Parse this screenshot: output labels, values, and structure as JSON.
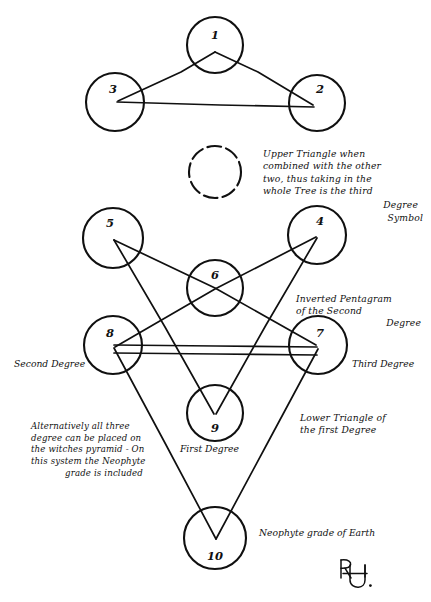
{
  "diagram": {
    "ink_color": "#101010",
    "background_color": "#ffffff",
    "spheres": [
      {
        "id": "sphere-1",
        "number": "1",
        "cx": 215,
        "cy": 45,
        "r": 28,
        "style": "solid"
      },
      {
        "id": "sphere-2",
        "number": "2",
        "cx": 317,
        "cy": 103,
        "r": 28,
        "style": "solid"
      },
      {
        "id": "sphere-3",
        "number": "3",
        "cx": 115,
        "cy": 102,
        "r": 29,
        "style": "solid"
      },
      {
        "id": "sphere-daath",
        "number": "",
        "cx": 215,
        "cy": 172,
        "r": 26,
        "style": "dashed"
      },
      {
        "id": "sphere-4",
        "number": "4",
        "cx": 317,
        "cy": 235,
        "r": 29,
        "style": "solid"
      },
      {
        "id": "sphere-5",
        "number": "5",
        "cx": 113,
        "cy": 238,
        "r": 30,
        "style": "solid"
      },
      {
        "id": "sphere-6",
        "number": "6",
        "cx": 215,
        "cy": 288,
        "r": 28,
        "style": "solid"
      },
      {
        "id": "sphere-7",
        "number": "7",
        "cx": 318,
        "cy": 345,
        "r": 29,
        "style": "solid"
      },
      {
        "id": "sphere-8",
        "number": "8",
        "cx": 113,
        "cy": 345,
        "r": 29,
        "style": "solid"
      },
      {
        "id": "sphere-9",
        "number": "9",
        "cx": 215,
        "cy": 413,
        "r": 28,
        "style": "solid"
      },
      {
        "id": "sphere-10",
        "number": "10",
        "cx": 215,
        "cy": 538,
        "r": 31,
        "style": "solid"
      }
    ],
    "annotations": {
      "upper_triangle_note": "Upper Triangle when\ncombined with the other\ntwo, thus taking in the\nwhole Tree is the third",
      "upper_triangle_note_tail_1": "Degree",
      "upper_triangle_note_tail_2": "Symbol",
      "inverted_pentagram_note": "Inverted Pentagram\nof the Second",
      "inverted_pentagram_note_tail": "Degree",
      "witches_pyramid_note": "Alternatively all three\ndegree can be placed on\nthe witches pyramid - On\nthis system the Neophyte",
      "witches_pyramid_note_tail": "grade is included",
      "lower_triangle_note": "Lower Triangle of\nthe first Degree",
      "second_degree_label": "Second Degree",
      "third_degree_label": "Third Degree",
      "first_degree_label": "First Degree",
      "neophyte_label": "Neophyte grade of Earth",
      "signature_monogram": "monogram"
    }
  }
}
